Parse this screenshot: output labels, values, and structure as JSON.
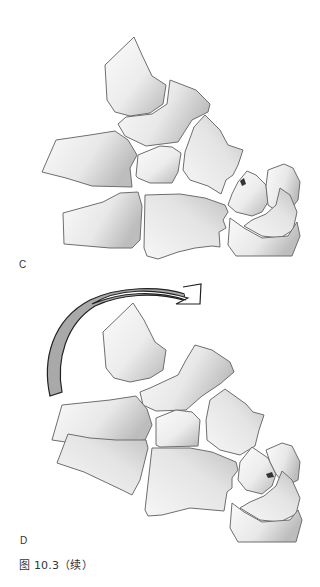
{
  "figure": {
    "caption": "图 10.3（续）",
    "panels": [
      {
        "label": "C",
        "description": "Carpal bones layout, dorsal view"
      },
      {
        "label": "D",
        "description": "Carpal bones with curved rotation arrow"
      }
    ]
  },
  "colors": {
    "background": "#ffffff",
    "bone_fill_light": "#f7f7f7",
    "bone_fill_dark": "#bcbcbc",
    "bone_outline": "#6e6e6e",
    "arrow_outline": "#222222",
    "arrow_band": "#a9a9a9",
    "text": "#333333"
  },
  "icons": {
    "rotation_arrow": "curved-arrow-clockwise"
  }
}
